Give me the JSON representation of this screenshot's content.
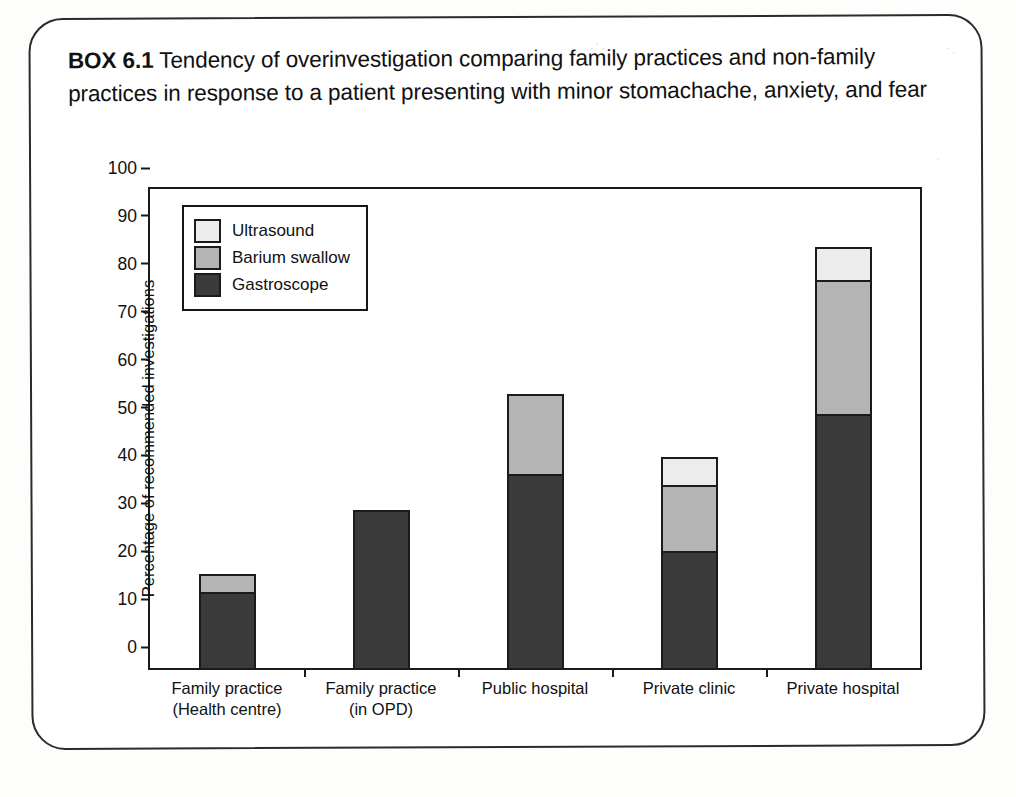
{
  "page": {
    "box_label": "BOX 6.1",
    "title_text": " Tendency of overinvestigation comparing family practices and non-family practices in response to a patient presenting with minor stomachache, anxiety, and fear"
  },
  "colors": {
    "ultrasound": "#ececec",
    "barium_swallow": "#b4b4b4",
    "gastroscope": "#3a3a3a",
    "axis": "#1a1a1a",
    "page_border": "#2b2b2b",
    "background": "#ffffff"
  },
  "chart_data": {
    "type": "bar",
    "stacked": true,
    "title": "",
    "xlabel": "",
    "ylabel": "Percentage of recommended investigations",
    "ylim": [
      0,
      100
    ],
    "yticks": [
      0,
      10,
      20,
      30,
      40,
      50,
      60,
      70,
      80,
      90,
      100
    ],
    "ytick_labels": [
      "0",
      "10",
      "20",
      "30",
      "40",
      "50",
      "60",
      "70",
      "80",
      "90",
      "100"
    ],
    "grid": false,
    "legend_position": "upper left",
    "categories": [
      "Family practice\n(Health centre)",
      "Family practice\n(in OPD)",
      "Public hospital",
      "Private clinic",
      "Private hospital"
    ],
    "category_lines": [
      [
        "Family practice",
        "(Health centre)"
      ],
      [
        "Family practice",
        "(in OPD)"
      ],
      [
        "Public hospital"
      ],
      [
        "Private clinic"
      ],
      [
        "Private hospital"
      ]
    ],
    "series": [
      {
        "name": "Gastroscope",
        "color": "#3a3a3a",
        "values": [
          15.9,
          33.0,
          40.5,
          24.4,
          53.0
        ]
      },
      {
        "name": "Barium swallow",
        "color": "#b4b4b4",
        "values": [
          3.8,
          0.0,
          16.8,
          13.9,
          28.0
        ]
      },
      {
        "name": "Ultrasound",
        "color": "#ececec",
        "values": [
          0.0,
          0.0,
          0.0,
          5.7,
          7.0
        ]
      }
    ],
    "totals": [
      19.7,
      33.0,
      57.3,
      44.0,
      88.0
    ],
    "legend_order": [
      "Ultrasound",
      "Barium swallow",
      "Gastroscope"
    ]
  }
}
